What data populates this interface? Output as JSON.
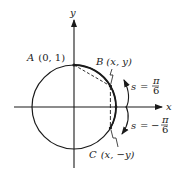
{
  "diagram": {
    "type": "unit-circle",
    "axes": {
      "x_label": "x",
      "y_label": "y"
    },
    "points": {
      "A": {
        "name": "A",
        "coords": "(0, 1)"
      },
      "B": {
        "name": "B",
        "coords": "(x, y)"
      },
      "C": {
        "name": "C",
        "coords": "(x, −y)"
      }
    },
    "arcs": {
      "positive": {
        "var": "s",
        "eq": "=",
        "num": "π",
        "den": "6",
        "sign": ""
      },
      "negative": {
        "var": "s",
        "eq": "=",
        "num": "π",
        "den": "6",
        "sign": "−"
      }
    },
    "colors": {
      "stroke": "#1a1a1a",
      "background": "#ffffff"
    }
  }
}
